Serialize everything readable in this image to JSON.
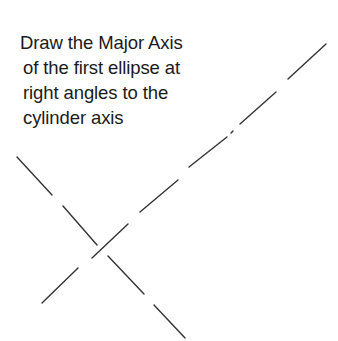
{
  "instruction": {
    "lines": [
      "Draw the Major Axis",
      "of the first ellipse at",
      "right angles to the",
      "cylinder axis"
    ]
  },
  "diagram": {
    "stroke_color": "#333333",
    "cylinder_axis": {
      "description": "dash-dot centre line rising from bottom-left to top-right",
      "segments": [
        [
          326,
          44,
          288,
          79
        ],
        [
          276,
          92,
          240,
          124
        ],
        [
          233,
          131,
          231,
          133
        ],
        [
          227,
          137,
          189,
          167
        ],
        [
          178,
          180,
          140,
          212
        ],
        [
          128,
          224,
          92,
          258
        ],
        [
          78,
          268,
          42,
          303
        ]
      ]
    },
    "major_axis": {
      "description": "dashed line at right angles to the cylinder axis, falling from top-left to bottom-right",
      "segments": [
        [
          17,
          157,
          52,
          195
        ],
        [
          63,
          206,
          97,
          245
        ],
        [
          108,
          256,
          144,
          294
        ],
        [
          154,
          305,
          185,
          338
        ]
      ]
    }
  }
}
